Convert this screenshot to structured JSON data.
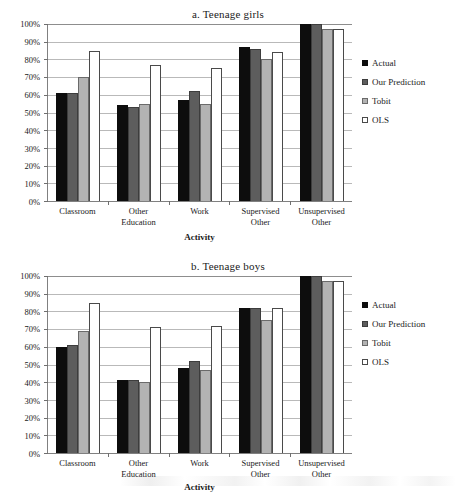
{
  "figure": {
    "charts": [
      {
        "id": "teenage-girls",
        "title": "a. Teenage girls",
        "xlabel": "Activity"
      },
      {
        "id": "teenage-boys",
        "title": "b. Teenage boys",
        "xlabel": "Activity"
      }
    ],
    "legend": {
      "items": [
        {
          "label": "Actual",
          "color": "#0d0d0d",
          "swatch": "filled-square-black"
        },
        {
          "label": "Our Prediction",
          "color": "#5d5d5d",
          "swatch": "filled-square-dark-gray"
        },
        {
          "label": "Tobit",
          "color": "#b3b3b3",
          "swatch": "filled-square-light-gray"
        },
        {
          "label": "OLS",
          "color": "#ffffff",
          "swatch": "open-square-white"
        }
      ]
    },
    "y_tick_labels": [
      "100%",
      "90%",
      "80%",
      "70%",
      "60%",
      "50%",
      "40%",
      "30%",
      "20%",
      "10%",
      "0%"
    ]
  },
  "chart_data": [
    {
      "type": "bar",
      "title": "a. Teenage girls",
      "subtitle": "",
      "xlabel": "Activity",
      "ylabel": "",
      "ylim": [
        0,
        100
      ],
      "yticks": [
        0,
        10,
        20,
        30,
        40,
        50,
        60,
        70,
        80,
        90,
        100
      ],
      "ytick_labels": [
        "0%",
        "10%",
        "20%",
        "30%",
        "40%",
        "50%",
        "60%",
        "70%",
        "80%",
        "90%",
        "100%"
      ],
      "grid": true,
      "legend_position": "right",
      "categories": [
        "Classroom",
        "Other Education",
        "Work",
        "Supervised Other",
        "Unsupervised Other"
      ],
      "category_lines": [
        [
          "Classroom",
          ""
        ],
        [
          "Other",
          "Education"
        ],
        [
          "Work",
          ""
        ],
        [
          "Supervised",
          "Other"
        ],
        [
          "Unsupervised",
          "Other"
        ]
      ],
      "series": [
        {
          "name": "Actual",
          "color": "#0d0d0d",
          "values": [
            61,
            54,
            57,
            87,
            100
          ]
        },
        {
          "name": "Our Prediction",
          "color": "#5d5d5d",
          "values": [
            61,
            53,
            62,
            86,
            100
          ]
        },
        {
          "name": "Tobit",
          "color": "#b3b3b3",
          "values": [
            70,
            55,
            55,
            80,
            97
          ]
        },
        {
          "name": "OLS",
          "color": "#ffffff",
          "values": [
            85,
            77,
            75,
            84,
            97
          ]
        }
      ]
    },
    {
      "type": "bar",
      "title": "b. Teenage boys",
      "subtitle": "",
      "xlabel": "Activity",
      "ylabel": "",
      "ylim": [
        0,
        100
      ],
      "yticks": [
        0,
        10,
        20,
        30,
        40,
        50,
        60,
        70,
        80,
        90,
        100
      ],
      "ytick_labels": [
        "0%",
        "10%",
        "20%",
        "30%",
        "40%",
        "50%",
        "60%",
        "70%",
        "80%",
        "90%",
        "100%"
      ],
      "grid": true,
      "legend_position": "right",
      "categories": [
        "Classroom",
        "Other Education",
        "Work",
        "Supervised Other",
        "Unsupervised Other"
      ],
      "category_lines": [
        [
          "Classroom",
          ""
        ],
        [
          "Other",
          "Education"
        ],
        [
          "Work",
          ""
        ],
        [
          "Supervised",
          "Other"
        ],
        [
          "Unsupervised",
          "Other"
        ]
      ],
      "series": [
        {
          "name": "Actual",
          "color": "#0d0d0d",
          "values": [
            60,
            41,
            48,
            82,
            100
          ]
        },
        {
          "name": "Our Prediction",
          "color": "#5d5d5d",
          "values": [
            61,
            41,
            52,
            82,
            100
          ]
        },
        {
          "name": "Tobit",
          "color": "#b3b3b3",
          "values": [
            69,
            40,
            47,
            75,
            97
          ]
        },
        {
          "name": "OLS",
          "color": "#ffffff",
          "values": [
            85,
            71,
            72,
            82,
            97
          ]
        }
      ]
    }
  ]
}
